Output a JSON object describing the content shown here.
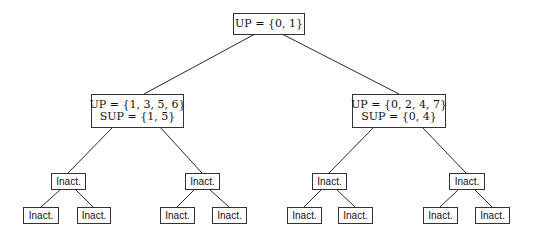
{
  "tree": {
    "root": {
      "line1": "UP = {0, 1}"
    },
    "left": {
      "line1": "UP = {1, 3, 5, 6}",
      "line2": "SUP = {1, 5}"
    },
    "right": {
      "line1": "UP = {0, 2, 4, 7}",
      "line2": "SUP = {0, 4}"
    },
    "level3": [
      "Inact.",
      "Inact.",
      "Inact.",
      "Inact."
    ],
    "leaves": [
      "Inact.",
      "Inact.",
      "Inact.",
      "Inact.",
      "Inact.",
      "Inact.",
      "Inact.",
      "Inact."
    ]
  },
  "colors": {
    "stroke": "#333333",
    "text": "#111111",
    "background": "#ffffff"
  }
}
